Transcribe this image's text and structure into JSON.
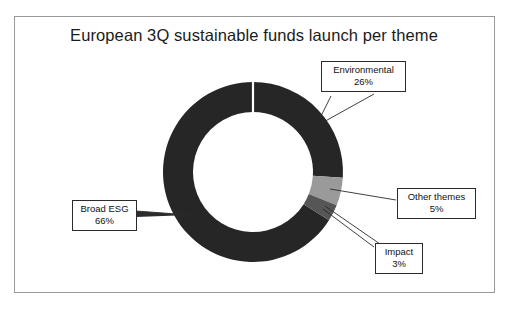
{
  "figure": {
    "title": "European 3Q sustainable funds launch per theme",
    "frame_border_color": "#9a9a9a",
    "background": "#ffffff"
  },
  "chart_data": {
    "type": "pie",
    "variant": "donut",
    "title": "European 3Q sustainable funds launch per theme",
    "xlabel": "",
    "ylabel": "",
    "unit": "%",
    "total": 100,
    "legend_position": "callout-labels",
    "grid": false,
    "categories": [
      "Environmental",
      "Other themes",
      "Impact",
      "Broad ESG"
    ],
    "values": [
      26,
      5,
      3,
      66
    ],
    "colors": [
      "#262626",
      "#9a9a9a",
      "#565656",
      "#262626"
    ],
    "start_angle_deg": 0,
    "direction": "clockwise",
    "slices": [
      {
        "label": "Environmental",
        "value": 26,
        "display": "26%",
        "color": "#262626",
        "start_deg": 0,
        "end_deg": 93.6
      },
      {
        "label": "Other themes",
        "value": 5,
        "display": "5%",
        "color": "#9a9a9a",
        "start_deg": 93.6,
        "end_deg": 111.6
      },
      {
        "label": "Impact",
        "value": 3,
        "display": "3%",
        "color": "#565656",
        "start_deg": 111.6,
        "end_deg": 122.4
      },
      {
        "label": "Broad ESG",
        "value": 66,
        "display": "66%",
        "color": "#262626",
        "start_deg": 122.4,
        "end_deg": 360
      }
    ]
  },
  "callouts": {
    "environmental": {
      "name": "Environmental",
      "value": "26%"
    },
    "other_themes": {
      "name": "Other themes",
      "value": "5%"
    },
    "impact": {
      "name": "Impact",
      "value": "3%"
    },
    "broad_esg": {
      "name": "Broad ESG",
      "value": "66%"
    }
  }
}
